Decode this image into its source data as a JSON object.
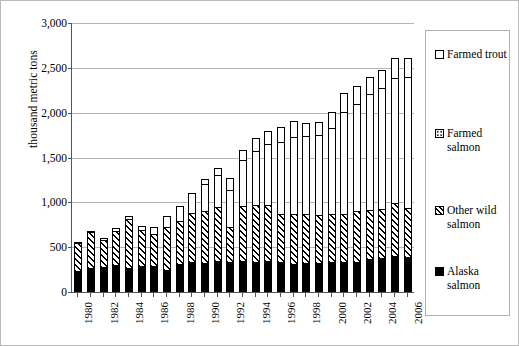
{
  "chart_data": {
    "type": "bar",
    "stacked": true,
    "title": "",
    "xlabel": "",
    "ylabel": "thousand metric tons",
    "ylim": [
      0,
      3000
    ],
    "ytick_values": [
      0,
      500,
      1000,
      1500,
      2000,
      2500,
      3000
    ],
    "ytick_labels": [
      "0",
      "500",
      "1,000",
      "1,500",
      "2,000",
      "2,500",
      "3,000"
    ],
    "grid": true,
    "legend_position": "right",
    "categories": [
      1980,
      1981,
      1982,
      1983,
      1984,
      1985,
      1986,
      1987,
      1988,
      1989,
      1990,
      1991,
      1992,
      1993,
      1994,
      1995,
      1996,
      1997,
      1998,
      1999,
      2000,
      2001,
      2002,
      2003,
      2004,
      2005,
      2006
    ],
    "xtick_labels": [
      "1980",
      "1982",
      "1984",
      "1986",
      "1988",
      "1990",
      "1992",
      "1994",
      "1996",
      "1998",
      "2000",
      "2002",
      "2004",
      "2006"
    ],
    "series": [
      {
        "name": "Alaska salmon",
        "pattern": "solid-black",
        "color": "#000000",
        "values": [
          235,
          270,
          280,
          300,
          265,
          290,
          290,
          250,
          310,
          330,
          320,
          345,
          335,
          345,
          340,
          350,
          330,
          310,
          325,
          320,
          330,
          335,
          340,
          370,
          380,
          400,
          390
        ]
      },
      {
        "name": "Other wild salmon",
        "pattern": "diagonal-hatch",
        "color": "#ffffff",
        "values": [
          310,
          395,
          295,
          380,
          555,
          405,
          360,
          480,
          480,
          550,
          580,
          600,
          385,
          615,
          630,
          620,
          545,
          555,
          545,
          540,
          545,
          540,
          560,
          545,
          550,
          595,
          545
        ]
      },
      {
        "name": "Farmed salmon",
        "pattern": "dotted",
        "color": "#ffffff",
        "values": [
          10,
          20,
          25,
          30,
          30,
          45,
          70,
          120,
          165,
          230,
          310,
          360,
          420,
          510,
          600,
          680,
          800,
          860,
          870,
          890,
          950,
          1130,
          1200,
          1290,
          1340,
          1390,
          1460
        ]
      },
      {
        "name": "Farmed trout",
        "pattern": "white-empty",
        "color": "#ffffff",
        "values": [
          0,
          0,
          0,
          0,
          0,
          0,
          0,
          0,
          0,
          0,
          55,
          75,
          135,
          115,
          145,
          150,
          170,
          180,
          150,
          150,
          180,
          220,
          200,
          195,
          210,
          220,
          215
        ]
      }
    ],
    "totals": [
      555,
      685,
      600,
      710,
      850,
      740,
      720,
      850,
      955,
      1110,
      1265,
      1380,
      1275,
      1585,
      1715,
      1800,
      1845,
      1905,
      1890,
      1900,
      2005,
      2225,
      2300,
      2400,
      2480,
      2605,
      2610
    ]
  },
  "legend": {
    "items": [
      {
        "label": "Farmed trout",
        "pattern": "white-empty"
      },
      {
        "label": "Farmed salmon",
        "pattern": "dotted"
      },
      {
        "label": "Other wild salmon",
        "pattern": "diagonal-hatch"
      },
      {
        "label": "Alaska salmon",
        "pattern": "solid-black"
      }
    ]
  }
}
